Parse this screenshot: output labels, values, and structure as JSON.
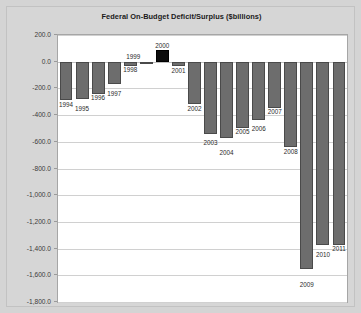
{
  "chart_data": {
    "type": "bar",
    "title": "Federal On-Budget Deficit/Surplus ($billions)",
    "xlabel": "",
    "ylabel": "",
    "categories": [
      "1994",
      "1995",
      "1996",
      "1997",
      "1998",
      "1999",
      "2000",
      "2001",
      "2002",
      "2003",
      "2004",
      "2005",
      "2006",
      "2007",
      "2008",
      "2009",
      "2010",
      "2011"
    ],
    "values": [
      -290,
      -280,
      -240,
      -170,
      -30,
      1,
      87,
      -33,
      -320,
      -540,
      -570,
      -495,
      -435,
      -345,
      -640,
      -1550,
      -1370,
      -1370
    ],
    "ylim": [
      -1800,
      200
    ],
    "ytick_labels": [
      "200.0",
      "0.0",
      "-200.0",
      "-400.0",
      "-600.0",
      "-800.0",
      "-1,000.0",
      "-1,200.0",
      "-1,400.0",
      "-1,600.0",
      "-1,800.0"
    ],
    "ytick_values": [
      200,
      0,
      -200,
      -400,
      -600,
      -800,
      -1000,
      -1200,
      -1400,
      -1600,
      -1800
    ],
    "grid": true,
    "legend": "none",
    "bar_color": "#6d6d6d",
    "highlight_color": "#0d0d0d",
    "highlight_category": "2000",
    "plot_background": "#ffffff",
    "chart_background": "#d6d6d6"
  }
}
